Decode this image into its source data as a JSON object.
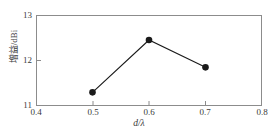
{
  "chart_data": {
    "type": "line",
    "title": "",
    "subtitle": "",
    "xlabel": "d/λ",
    "ylabel": "增益/dBi",
    "x": [
      0.5,
      0.6,
      0.7
    ],
    "values": [
      11.3,
      12.45,
      11.85
    ],
    "series": [
      {
        "name": "增益",
        "x": [
          0.5,
          0.6,
          0.7
        ],
        "values": [
          11.3,
          12.45,
          11.85
        ],
        "marker": "filled-circle",
        "color": "#1a1a1a"
      }
    ],
    "xlim": [
      0.4,
      0.8
    ],
    "ylim": [
      11,
      13
    ],
    "xticks": [
      0.4,
      0.5,
      0.6,
      0.7,
      0.8
    ],
    "xtick_labels": [
      "0.4",
      "0.5",
      "0.6",
      "0.7",
      "0.8"
    ],
    "yticks": [
      11,
      12,
      13
    ],
    "ytick_labels": [
      "11",
      "12",
      "13"
    ],
    "grid": false,
    "legend": false,
    "legend_position": "none",
    "frame_color": "#8c8c8c",
    "line_color": "#1a1a1a",
    "background": "#ffffff"
  },
  "axes": {
    "x_tick_0": "0.4",
    "x_tick_1": "0.5",
    "x_tick_2": "0.6",
    "x_tick_3": "0.7",
    "x_tick_4": "0.8",
    "y_tick_0": "11",
    "y_tick_1": "12",
    "y_tick_2": "13",
    "x_axis_title": "d/λ",
    "y_axis_title": "增益/dBi"
  }
}
